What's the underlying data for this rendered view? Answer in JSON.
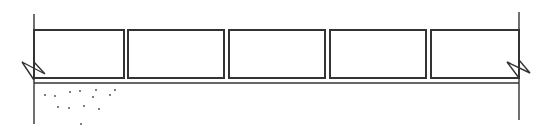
{
  "diagram": {
    "type": "masonry-section-sketch",
    "stroke_color": "#333333",
    "background": "#ffffff",
    "left_wall": {
      "x": 34,
      "y_top": 14,
      "y_bottom": 124
    },
    "right_wall": {
      "x": 519,
      "y_top": 12,
      "y_bottom": 120
    },
    "blocks": [
      {
        "x": 34,
        "y": 30,
        "w": 90,
        "h": 48
      },
      {
        "x": 128,
        "y": 30,
        "w": 96,
        "h": 48
      },
      {
        "x": 229,
        "y": 30,
        "w": 96,
        "h": 48
      },
      {
        "x": 330,
        "y": 30,
        "w": 96,
        "h": 48
      },
      {
        "x": 431,
        "y": 30,
        "w": 88,
        "h": 48
      }
    ],
    "bed_line": {
      "y": 83,
      "x_start": 34,
      "x_end": 519
    },
    "break_symbols": [
      {
        "side": "left",
        "x": 34,
        "y": 70
      },
      {
        "side": "right",
        "x": 519,
        "y": 70
      }
    ],
    "stipple_dots": [
      [
        45,
        95
      ],
      [
        55,
        96
      ],
      [
        70,
        92
      ],
      [
        80,
        91
      ],
      [
        96,
        90
      ],
      [
        93,
        97
      ],
      [
        110,
        95
      ],
      [
        115,
        90
      ],
      [
        58,
        107
      ],
      [
        69,
        108
      ],
      [
        84,
        106
      ],
      [
        99,
        109
      ],
      [
        81,
        124
      ]
    ]
  }
}
